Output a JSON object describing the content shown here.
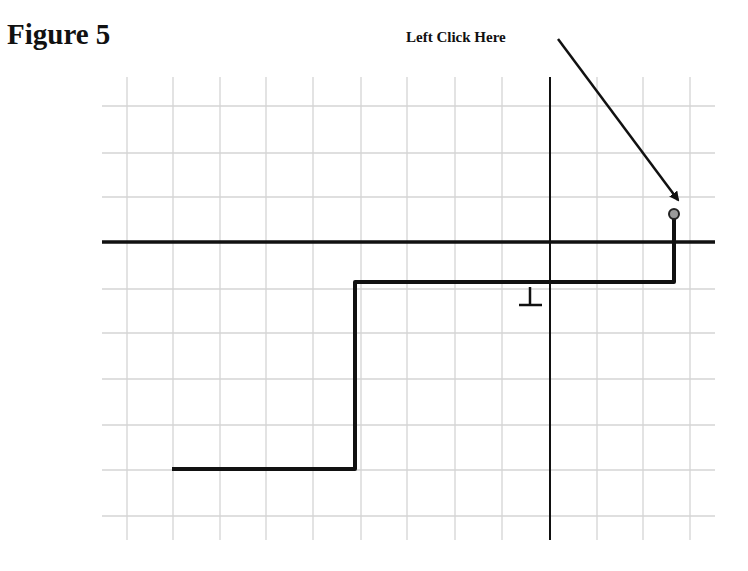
{
  "figure": {
    "title": "Figure 5"
  },
  "callout": {
    "label": "Left Click Here",
    "arrow": {
      "from": [
        558,
        39
      ],
      "to": [
        678,
        200
      ]
    },
    "target_icon": "endpoint-grip-circle"
  },
  "grid": {
    "left": 102,
    "right": 715,
    "top": 77,
    "bottom": 540,
    "vertical_lines_x": [
      127,
      173,
      220,
      266,
      313,
      361,
      407,
      455,
      502,
      597,
      643,
      690
    ],
    "horizontal_lines_y": [
      106,
      153,
      197,
      289,
      333,
      379,
      425,
      470,
      516
    ],
    "line_color": "#d4d4d4"
  },
  "axes": {
    "horizontal": {
      "y": 242,
      "x1": 102,
      "x2": 715
    },
    "vertical": {
      "x": 550,
      "y1": 77,
      "y2": 540
    },
    "color": "#111111"
  },
  "step_path": {
    "points": [
      [
        172,
        469
      ],
      [
        355,
        469
      ],
      [
        355,
        282
      ],
      [
        674,
        282
      ],
      [
        674,
        219
      ]
    ],
    "color": "#111111",
    "stroke_width": 4
  },
  "endpoint": {
    "cx": 674,
    "cy": 214,
    "r": 5,
    "fill": "#9a9a9a",
    "stroke": "#222222"
  },
  "ground_symbol": {
    "stem": [
      530,
      287,
      530,
      304
    ],
    "base": [
      519,
      305,
      542,
      305
    ]
  }
}
